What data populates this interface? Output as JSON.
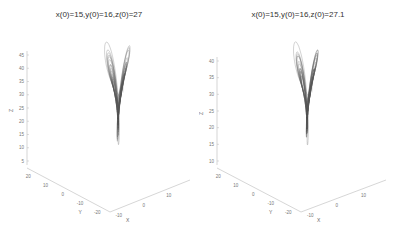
{
  "chart_data": [
    {
      "type": "line3d",
      "title": "x(0)=15,y(0)=16,z(0)=27",
      "xlabel": "X",
      "ylabel": "Y",
      "zlabel": "Z",
      "x_ticks": [
        "-10",
        "0",
        "10"
      ],
      "y_ticks": [
        "20",
        "10",
        "0",
        "-10",
        "-20"
      ],
      "z_ticks": [
        "45",
        "40",
        "35",
        "30",
        "25",
        "20",
        "15",
        "10",
        "5"
      ],
      "zlim": [
        5,
        45
      ],
      "initial_conditions": {
        "x0": 15,
        "y0": 16,
        "z0": 27
      },
      "grid": false,
      "color": "#555555"
    },
    {
      "type": "line3d",
      "title": "x(0)=15,y(0)=16,z(0)=27.1",
      "xlabel": "X",
      "ylabel": "Y",
      "zlabel": "Z",
      "x_ticks": [
        "-10",
        "0",
        "10"
      ],
      "y_ticks": [
        "20",
        "10",
        "0",
        "-10",
        "-20"
      ],
      "z_ticks": [
        "40",
        "35",
        "30",
        "25",
        "20",
        "15",
        "10"
      ],
      "zlim": [
        10,
        42
      ],
      "initial_conditions": {
        "x0": 15,
        "y0": 16,
        "z0": 27.1
      },
      "grid": false,
      "color": "#555555"
    }
  ],
  "plots": [
    {
      "title": "x(0)=15,y(0)=16,z(0)=27",
      "xlabel": "X",
      "ylabel": "Y",
      "zlabel": "Z",
      "z_ticks": [
        "45",
        "40",
        "35",
        "30",
        "25",
        "20",
        "15",
        "10",
        "5"
      ],
      "y_ticks": [
        "20",
        "10",
        "0",
        "-10",
        "-20"
      ],
      "x_ticks": [
        "-10",
        "0",
        "10"
      ]
    },
    {
      "title": "x(0)=15,y(0)=16,z(0)=27.1",
      "xlabel": "X",
      "ylabel": "Y",
      "zlabel": "Z",
      "z_ticks": [
        "40",
        "35",
        "30",
        "25",
        "20",
        "15",
        "10"
      ],
      "y_ticks": [
        "20",
        "10",
        "0",
        "-10",
        "-20"
      ],
      "x_ticks": [
        "-10",
        "0",
        "10"
      ]
    }
  ]
}
